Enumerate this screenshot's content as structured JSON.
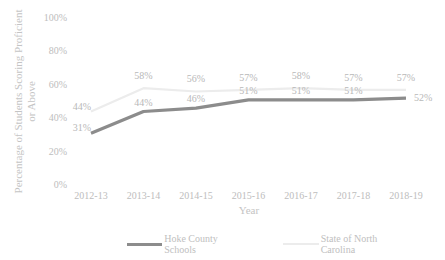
{
  "chart_data": {
    "type": "line",
    "title": "",
    "xlabel": "Year",
    "ylabel": "Percentage of Students Scoring Proficient or Above",
    "ylabel_lines": [
      "Percentage of Students Scoring Proficient",
      "or Above"
    ],
    "categories": [
      "2012-13",
      "2013-14",
      "2014-15",
      "2015-16",
      "2016-17",
      "2017-18",
      "2018-19"
    ],
    "yticks": [
      "0%",
      "20%",
      "40%",
      "60%",
      "80%",
      "100%"
    ],
    "ylim": [
      0,
      100
    ],
    "grid": false,
    "legend_position": "bottom",
    "series": [
      {
        "name": "Hoke County Schools",
        "values": [
          31,
          44,
          46,
          51,
          51,
          51,
          52
        ],
        "labels": [
          "31%",
          "44%",
          "46%",
          "51%",
          "51%",
          "51%",
          "52%"
        ],
        "color": "#8c8c8c"
      },
      {
        "name": "State of North Carolina",
        "values": [
          44,
          58,
          56,
          57,
          58,
          57,
          57
        ],
        "labels": [
          "44%",
          "58%",
          "56%",
          "57%",
          "58%",
          "57%",
          "57%"
        ],
        "color": "#ececec"
      }
    ]
  },
  "legend": {
    "items": [
      {
        "label": "Hoke County Schools",
        "color": "#8c8c8c"
      },
      {
        "label": "State of North Carolina",
        "color": "#ececec"
      }
    ]
  }
}
